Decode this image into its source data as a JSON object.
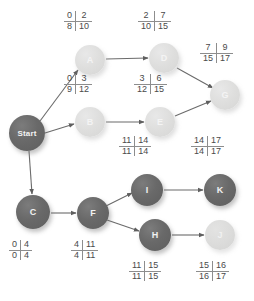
{
  "diagram": {
    "colors": {
      "dark_node": "#696969",
      "light_node": "#dededd",
      "edge": "#6b6b6b",
      "label_text": "#4a4a4a",
      "background": "#ffffff"
    },
    "nodes": [
      {
        "id": "start",
        "label": "Start",
        "shade": "dark",
        "cx": 27,
        "cy": 133,
        "r": 18
      },
      {
        "id": "a",
        "label": "A",
        "shade": "light",
        "cx": 90,
        "cy": 60,
        "r": 15
      },
      {
        "id": "b",
        "label": "B",
        "shade": "light",
        "cx": 90,
        "cy": 122,
        "r": 15
      },
      {
        "id": "c",
        "label": "C",
        "shade": "dark",
        "cx": 33,
        "cy": 212,
        "r": 17
      },
      {
        "id": "d",
        "label": "D",
        "shade": "light",
        "cx": 164,
        "cy": 58,
        "r": 15
      },
      {
        "id": "e",
        "label": "E",
        "shade": "light",
        "cx": 160,
        "cy": 122,
        "r": 15
      },
      {
        "id": "f",
        "label": "F",
        "shade": "dark",
        "cx": 93,
        "cy": 213,
        "r": 16
      },
      {
        "id": "g",
        "label": "G",
        "shade": "light",
        "cx": 225,
        "cy": 95,
        "r": 15
      },
      {
        "id": "h",
        "label": "H",
        "shade": "dark",
        "cx": 155,
        "cy": 235,
        "r": 16
      },
      {
        "id": "i",
        "label": "I",
        "shade": "dark",
        "cx": 147,
        "cy": 190,
        "r": 16
      },
      {
        "id": "j",
        "label": "J",
        "shade": "pale",
        "cx": 220,
        "cy": 235,
        "r": 15
      },
      {
        "id": "k",
        "label": "K",
        "shade": "dark",
        "cx": 220,
        "cy": 190,
        "r": 16
      }
    ],
    "edges": [
      {
        "from": "start",
        "to": "a"
      },
      {
        "from": "start",
        "to": "b"
      },
      {
        "from": "start",
        "to": "c"
      },
      {
        "from": "a",
        "to": "d"
      },
      {
        "from": "b",
        "to": "e"
      },
      {
        "from": "d",
        "to": "g"
      },
      {
        "from": "e",
        "to": "g"
      },
      {
        "from": "c",
        "to": "f"
      },
      {
        "from": "f",
        "to": "i"
      },
      {
        "from": "f",
        "to": "h"
      },
      {
        "from": "i",
        "to": "k"
      },
      {
        "from": "h",
        "to": "j"
      }
    ],
    "schedule_boxes": [
      {
        "node": "a",
        "early_start": "0",
        "early_finish": "2",
        "late_start": "8",
        "late_finish": "10",
        "x": 64,
        "y": 11
      },
      {
        "node": "d",
        "early_start": "2",
        "early_finish": "7",
        "late_start": "10",
        "late_finish": "15",
        "x": 138,
        "y": 11
      },
      {
        "node": "g",
        "early_start": "7",
        "early_finish": "9",
        "late_start": "15",
        "late_finish": "17",
        "x": 200,
        "y": 43
      },
      {
        "node": "b",
        "early_start": "0",
        "early_finish": "3",
        "late_start": "9",
        "late_finish": "12",
        "x": 64,
        "y": 74
      },
      {
        "node": "e",
        "early_start": "3",
        "early_finish": "6",
        "late_start": "12",
        "late_finish": "15",
        "x": 134,
        "y": 74
      },
      {
        "node": "i",
        "early_start": "11",
        "early_finish": "14",
        "late_start": "11",
        "late_finish": "14",
        "x": 119,
        "y": 136
      },
      {
        "node": "k",
        "early_start": "14",
        "early_finish": "17",
        "late_start": "14",
        "late_finish": "17",
        "x": 191,
        "y": 136
      },
      {
        "node": "c",
        "early_start": "0",
        "early_finish": "4",
        "late_start": "0",
        "late_finish": "4",
        "x": 9,
        "y": 240
      },
      {
        "node": "f",
        "early_start": "4",
        "early_finish": "11",
        "late_start": "4",
        "late_finish": "11",
        "x": 71,
        "y": 240
      },
      {
        "node": "h",
        "early_start": "11",
        "early_finish": "15",
        "late_start": "11",
        "late_finish": "15",
        "x": 129,
        "y": 261
      },
      {
        "node": "j",
        "early_start": "15",
        "early_finish": "16",
        "late_start": "16",
        "late_finish": "17",
        "x": 196,
        "y": 261
      }
    ]
  }
}
